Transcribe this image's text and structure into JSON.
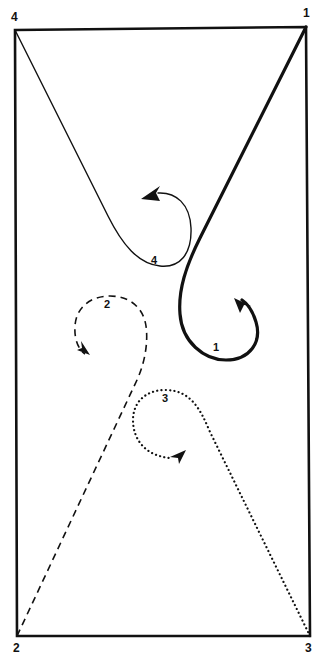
{
  "diagram": {
    "type": "movement-pattern",
    "stroke_color": "#111111",
    "background": "#ffffff",
    "boundary": {
      "shape": "rectangle",
      "corners": [
        {
          "id": "1",
          "label": "1",
          "position": "top-right"
        },
        {
          "id": "2",
          "label": "2",
          "position": "bottom-left"
        },
        {
          "id": "3",
          "label": "3",
          "position": "bottom-right"
        },
        {
          "id": "4",
          "label": "4",
          "position": "top-left"
        }
      ]
    },
    "paths": [
      {
        "id": "1",
        "label": "1",
        "start_corner": "1",
        "style": "thick-solid",
        "loop_direction": "counter-clockwise",
        "arrow": true
      },
      {
        "id": "2",
        "label": "2",
        "start_corner": "2",
        "style": "dashed",
        "loop_direction": "counter-clockwise",
        "arrow": true
      },
      {
        "id": "3",
        "label": "3",
        "start_corner": "3",
        "style": "dotted",
        "loop_direction": "counter-clockwise",
        "arrow": true
      },
      {
        "id": "4",
        "label": "4",
        "start_corner": "4",
        "style": "thin-solid",
        "loop_direction": "counter-clockwise",
        "arrow": true
      }
    ]
  }
}
